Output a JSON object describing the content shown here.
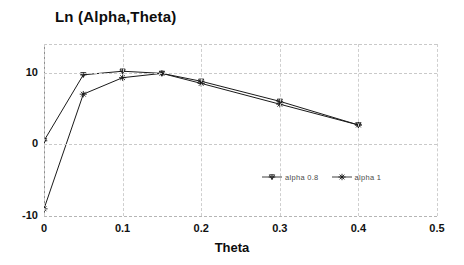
{
  "chart_data": {
    "type": "line",
    "title": "Ln (Alpha,Theta)",
    "xlabel": "Theta",
    "ylabel": "",
    "xlim": [
      0,
      0.5
    ],
    "ylim": [
      -10,
      14
    ],
    "xticks": [
      "0",
      "0.1",
      "0.2",
      "0.3",
      "0.4",
      "0.5"
    ],
    "xtick_values": [
      0,
      0.1,
      0.2,
      0.3,
      0.4,
      0.5
    ],
    "yticks": [
      "10",
      "0",
      "-10"
    ],
    "ytick_values": [
      10,
      0,
      -10
    ],
    "grid": true,
    "legend_position": "inside-lower-right",
    "x": [
      0,
      0.05,
      0.1,
      0.15,
      0.2,
      0.3,
      0.4
    ],
    "series": [
      {
        "name": "alpha 0.8",
        "marker": "cross-down",
        "values": [
          0.5,
          9.7,
          10.2,
          9.9,
          8.8,
          6.0,
          2.7
        ]
      },
      {
        "name": "alpha 1",
        "marker": "star",
        "values": [
          -9.0,
          7.0,
          9.3,
          9.9,
          8.5,
          5.6,
          2.7
        ]
      }
    ]
  },
  "legend": {
    "items": [
      {
        "label": "alpha 0.8"
      },
      {
        "label": "alpha 1"
      }
    ]
  },
  "axis": {
    "x_label": "Theta",
    "x_ticks": [
      "0",
      "0.1",
      "0.2",
      "0.3",
      "0.4",
      "0.5"
    ],
    "y_ticks": [
      "10",
      "0",
      "-10"
    ]
  },
  "title": "Ln (Alpha,Theta)"
}
